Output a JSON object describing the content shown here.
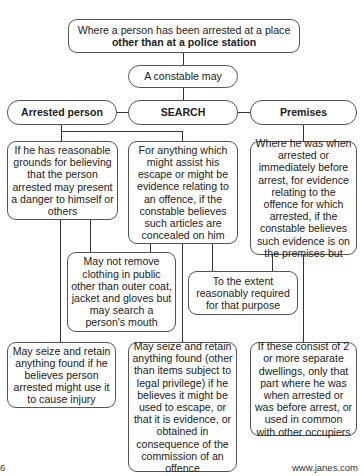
{
  "diagram": {
    "root": {
      "text_plain": "Where a person has been arrested at a place ",
      "text_bold": "other than at a police station"
    },
    "constable": "A constable may",
    "headers": {
      "arrested_person": "Arrested person",
      "search": "SEARCH",
      "premises": "Premises"
    },
    "row1": {
      "danger": "If he has reasonable grounds for believing that the person arrested may present a danger to himself or others",
      "escape": "For anything which might assist his escape or might be evidence relating to an offence, if the constable believes such articles are concealed on him",
      "premises_where": "Where he was when arrested or immediately before arrest, for evidence relating to the offence for which arrested, if the constable believes such evidence is on the premises but"
    },
    "row2": {
      "clothing": "May not remove clothing in public other than outer coat, jacket and gloves but may search a person's mouth",
      "extent": "To the extent reasonably required for that purpose"
    },
    "row3": {
      "seize_injury": "May seize and retain anything found if he believes person arrested might use it to cause injury",
      "seize_evidence": "May seize and retain anything found (other than items subject to legal privilege) if he believes it might be used to escape, or that it is evidence, or obtained in consequence of the commission of an offence",
      "dwellings": "If these consist of 2 or more separate dwellings, only that part where he was when arrested or was before arrest, or used in common with other occupiers"
    }
  },
  "footer": {
    "page_number": "6",
    "source": "www.janes.com"
  }
}
